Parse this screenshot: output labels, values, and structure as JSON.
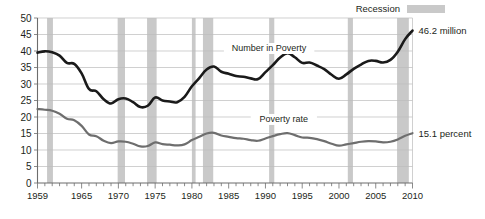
{
  "chart_data": {
    "type": "line",
    "title": "",
    "subtitle": "",
    "xlabel": "",
    "ylabel": "",
    "xlim": [
      1959,
      2010
    ],
    "ylim": [
      0,
      50
    ],
    "y_ticks": [
      0,
      5,
      10,
      15,
      20,
      25,
      30,
      35,
      40,
      45,
      50
    ],
    "y_tick_labels": [
      "0",
      "5",
      "10",
      "15",
      "20",
      "25",
      "30",
      "35",
      "40",
      "45",
      "50"
    ],
    "x_major_ticks": [
      1959,
      1965,
      1970,
      1975,
      1980,
      1985,
      1990,
      1995,
      2000,
      2005,
      2010
    ],
    "x_major_tick_labels": [
      "1959",
      "1965",
      "1970",
      "1975",
      "1980",
      "1985",
      "1990",
      "1995",
      "2000",
      "2005",
      "2010"
    ],
    "x_minor_tick_step": 1,
    "grid": "horizontal",
    "legend_position": "top-right",
    "x": [
      1959,
      1960,
      1961,
      1962,
      1963,
      1964,
      1965,
      1966,
      1967,
      1968,
      1969,
      1970,
      1971,
      1972,
      1973,
      1974,
      1975,
      1976,
      1977,
      1978,
      1979,
      1980,
      1981,
      1982,
      1983,
      1984,
      1985,
      1986,
      1987,
      1988,
      1989,
      1990,
      1991,
      1992,
      1993,
      1994,
      1995,
      1996,
      1997,
      1998,
      1999,
      2000,
      2001,
      2002,
      2003,
      2004,
      2005,
      2006,
      2007,
      2008,
      2009,
      2010
    ],
    "series": [
      {
        "name": "Number in Poverty",
        "units": "millions",
        "color": "#1a1a1a",
        "values": [
          39.5,
          39.9,
          39.6,
          38.6,
          36.4,
          36.1,
          33.2,
          28.5,
          27.8,
          25.4,
          24.1,
          25.4,
          25.6,
          24.5,
          23.0,
          23.4,
          25.9,
          25.0,
          24.7,
          24.5,
          26.1,
          29.3,
          31.8,
          34.4,
          35.3,
          33.7,
          33.1,
          32.4,
          32.2,
          31.7,
          31.5,
          33.6,
          35.7,
          38.0,
          39.3,
          38.1,
          36.4,
          36.5,
          35.6,
          34.5,
          32.8,
          31.6,
          32.9,
          34.6,
          35.9,
          37.0,
          37.0,
          36.5,
          37.3,
          39.8,
          43.6,
          46.2
        ]
      },
      {
        "name": "Poverty rate",
        "units": "percent",
        "color": "#6e6e6e",
        "values": [
          22.4,
          22.2,
          21.9,
          21.0,
          19.5,
          19.0,
          17.3,
          14.7,
          14.2,
          12.8,
          12.1,
          12.6,
          12.5,
          11.9,
          11.1,
          11.2,
          12.3,
          11.8,
          11.6,
          11.4,
          11.7,
          13.0,
          14.0,
          15.0,
          15.2,
          14.4,
          14.0,
          13.6,
          13.4,
          13.0,
          12.8,
          13.5,
          14.2,
          14.8,
          15.1,
          14.5,
          13.8,
          13.7,
          13.3,
          12.7,
          11.9,
          11.3,
          11.7,
          12.1,
          12.5,
          12.7,
          12.6,
          12.3,
          12.5,
          13.2,
          14.3,
          15.1
        ]
      }
    ],
    "recessions": [
      {
        "start": 1960.3,
        "end": 1961.1
      },
      {
        "start": 1969.9,
        "end": 1970.9
      },
      {
        "start": 1973.9,
        "end": 1975.2
      },
      {
        "start": 1980.0,
        "end": 1980.5
      },
      {
        "start": 1981.5,
        "end": 1982.9
      },
      {
        "start": 1990.5,
        "end": 1991.2
      },
      {
        "start": 2001.2,
        "end": 2001.9
      },
      {
        "start": 2007.9,
        "end": 2009.5
      }
    ],
    "annotations": [
      {
        "id": "number-in-poverty",
        "text": "Number in Poverty",
        "x": 1990.5,
        "y": 40.0
      },
      {
        "id": "poverty-rate",
        "text": "Poverty rate",
        "x": 1992.5,
        "y": 18.5
      }
    ],
    "endpoint_labels": [
      {
        "id": "number-endpoint",
        "text": "46.2 million",
        "series": "Number in Poverty",
        "year": 2010
      },
      {
        "id": "rate-endpoint",
        "text": "15.1 percent",
        "series": "Poverty rate",
        "year": 2010
      }
    ]
  },
  "legend": {
    "recession_label": "Recession",
    "recession_color": "#c9c9c9"
  },
  "colors": {
    "number_line": "#1a1a1a",
    "rate_line": "#6e6e6e",
    "recession_band": "#c9c9c9",
    "gridline": "#bcbcbc",
    "axis": "#6d6d6d",
    "text": "#231f20",
    "background": "#ffffff"
  }
}
